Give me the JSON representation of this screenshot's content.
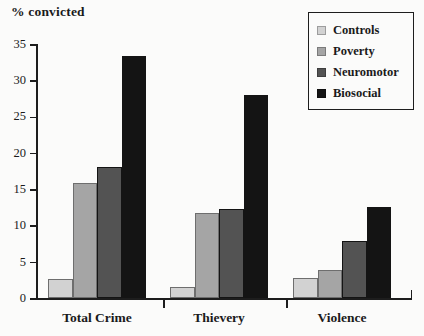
{
  "chart_data": {
    "type": "bar",
    "title": "",
    "ylabel": "% convicted",
    "xlabel": "",
    "categories": [
      "Total Crime",
      "Thievery",
      "Violence"
    ],
    "series": [
      {
        "name": "Controls",
        "color": "#d2d2d2",
        "values": [
          2.6,
          1.5,
          2.7
        ]
      },
      {
        "name": "Poverty",
        "color": "#a5a5a5",
        "values": [
          15.8,
          11.7,
          3.9
        ]
      },
      {
        "name": "Neuromotor",
        "color": "#535353",
        "values": [
          18.0,
          12.2,
          7.9
        ]
      },
      {
        "name": "Biosocial",
        "color": "#141414",
        "values": [
          33.4,
          28.0,
          12.6
        ]
      }
    ],
    "ylim": [
      0,
      35
    ],
    "yticks": [
      0,
      5,
      10,
      15,
      20,
      25,
      30,
      35
    ],
    "ytick_labels": [
      "0",
      "5",
      "10",
      "15",
      "20",
      "25",
      "30",
      "35"
    ],
    "grid": false,
    "legend_position": "top-right"
  },
  "legend": {
    "entries": [
      {
        "label": "Controls"
      },
      {
        "label": "Poverty"
      },
      {
        "label": "Neuromotor"
      },
      {
        "label": "Biosocial"
      }
    ]
  },
  "colors": {
    "axis": "#1d1d1d",
    "text": "#1a1a1a",
    "background": "#fbfbfa"
  }
}
